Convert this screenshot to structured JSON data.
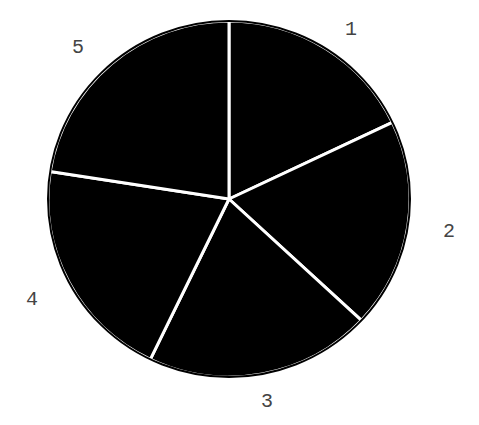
{
  "chart_data": {
    "type": "pie",
    "title": "",
    "labels": [
      "1",
      "2",
      "3",
      "4",
      "5"
    ],
    "values": [
      17.9,
      19.0,
      20.2,
      20.3,
      22.5
    ],
    "start_angle_deg": 90,
    "direction": "clockwise",
    "legend": "none",
    "slice_color": "#000000",
    "edge_color": "#ffffff"
  },
  "geometry": {
    "cx": 229,
    "cy": 199,
    "rx": 181,
    "ry": 178,
    "label_positions": [
      {
        "x": 351,
        "y": 35
      },
      {
        "x": 449,
        "y": 237
      },
      {
        "x": 267,
        "y": 407
      },
      {
        "x": 32,
        "y": 305
      },
      {
        "x": 78,
        "y": 53
      }
    ]
  }
}
